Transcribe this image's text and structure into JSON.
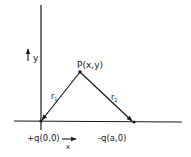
{
  "diagram": {
    "axis_labels": {
      "x": "x",
      "y": "y"
    },
    "points": {
      "positive_charge": {
        "label": "+q(0,0)"
      },
      "negative_charge": {
        "label": "-q(a,0)"
      },
      "field_point": {
        "label": "P(x,y)"
      }
    },
    "distances": {
      "r1": {
        "main": "r",
        "sub": "1"
      },
      "r2": {
        "main": "r",
        "sub": "2"
      }
    },
    "colors": {
      "ink": "#1a1a1a",
      "background": "#ffffff"
    }
  }
}
